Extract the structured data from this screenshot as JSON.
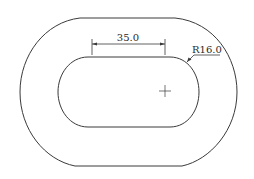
{
  "drawing": {
    "type": "technical-drawing",
    "subject": "obround slot within oval outline",
    "colors": {
      "line": "#3a3a3a",
      "background": "#ffffff"
    },
    "dimensions": {
      "linear": {
        "label": "35.0",
        "value": 35.0,
        "description": "distance between slot arc centers"
      },
      "radius": {
        "label": "R16.0",
        "value": 16.0,
        "description": "slot end radius"
      }
    },
    "center_mark": {
      "symbol": "+"
    }
  }
}
